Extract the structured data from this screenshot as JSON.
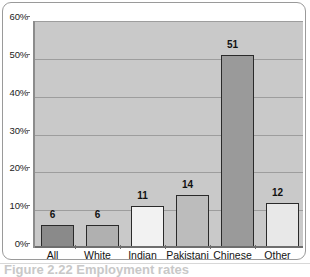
{
  "figure": {
    "caption": "Figure 2.22  Employment rates",
    "background_color": "#ffffff",
    "card_border_color": "#9a9a9a"
  },
  "chart_data": {
    "type": "bar",
    "title": "",
    "xlabel": "",
    "ylabel": "",
    "categories": [
      "All",
      "White",
      "Indian",
      "Pakistani",
      "Chinese",
      "Other"
    ],
    "values": [
      6,
      6,
      11,
      14,
      51,
      12
    ],
    "value_labels": [
      "6",
      "6",
      "11",
      "14",
      "51",
      "12"
    ],
    "bar_colors": [
      "#8a8a8a",
      "#b0b0b0",
      "#f2f2f2",
      "#bcbcbc",
      "#9a9a9a",
      "#e8e8e8"
    ],
    "bar_border_color": "#2a2a2a",
    "ylim": [
      0,
      60
    ],
    "ytick_values": [
      0,
      10,
      20,
      30,
      40,
      50,
      60
    ],
    "ytick_labels": [
      "0%",
      "10%",
      "20%",
      "30%",
      "40%",
      "50%",
      "60%"
    ],
    "grid": true,
    "gridline_color": "#9d9d9d",
    "plot_background": "#c9c9c9",
    "axis_color": "#6e6e6e",
    "legend": null
  }
}
